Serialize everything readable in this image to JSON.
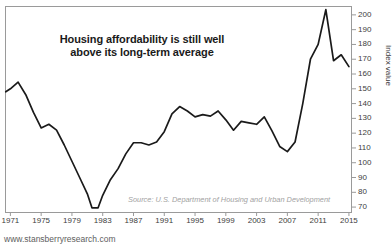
{
  "chart_data": {
    "type": "line",
    "title": "Housing affordability is still well above its long-term average",
    "title_lines": [
      "Housing affordability is still well",
      "above its long-term average"
    ],
    "xlabel": "",
    "ylabel": "Index value",
    "source": "Source: U.S. Department of Housing and Urban Development",
    "watermark": "www.stansberryresearch.com",
    "grid": false,
    "legend": "none",
    "xlim": [
      1970.3,
      2015.4
    ],
    "ylim": [
      66,
      206
    ],
    "y_ticks": [
      70,
      80,
      90,
      100,
      110,
      120,
      130,
      140,
      150,
      160,
      170,
      180,
      190,
      200
    ],
    "x_ticks": [
      1971,
      1975,
      1979,
      1983,
      1987,
      1991,
      1995,
      1999,
      2003,
      2007,
      2011,
      2015
    ],
    "line_color": "#1a1a1a",
    "series": [
      {
        "name": "Housing Affordability Index",
        "x": [
          1970.4,
          1971,
          1972,
          1973,
          1974,
          1975,
          1976,
          1977,
          1978,
          1979,
          1980,
          1981,
          1981.6,
          1982.4,
          1983,
          1984,
          1985,
          1986,
          1987,
          1988,
          1989,
          1990,
          1991,
          1992,
          1993,
          1994,
          1995,
          1996,
          1997,
          1998,
          1999,
          2000,
          2001,
          2002,
          2003,
          2004,
          2005,
          2006,
          2007,
          2008,
          2009,
          2010,
          2011,
          2012,
          2013,
          2014,
          2015
        ],
        "values": [
          148,
          150,
          154.5,
          146,
          134,
          123.5,
          126,
          122,
          112,
          101,
          90,
          79,
          69.5,
          69.5,
          78,
          88.5,
          96,
          106,
          113.5,
          113.5,
          112,
          114,
          121,
          133,
          138,
          135,
          131,
          132.5,
          131.5,
          135,
          129,
          122,
          128,
          127,
          126,
          131,
          121.5,
          111,
          107.5,
          114,
          140,
          170,
          180,
          203.5,
          169,
          173,
          165
        ]
      }
    ]
  }
}
